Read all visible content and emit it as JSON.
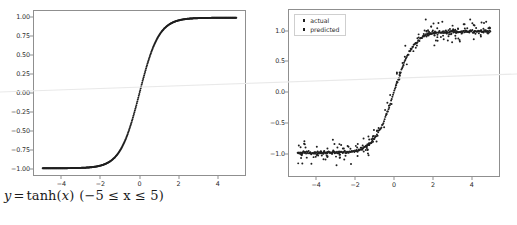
{
  "figure": {
    "background": "#ffffff",
    "marker_color": "#1f1f1f",
    "axis_color": "#8f8f8f",
    "text_color": "#2b2b2b"
  },
  "caption": {
    "full_text": "y = tanh(x) (−5 ≤ x ≤ 5)",
    "lhs": "y",
    "eq": "=",
    "func": "tanh",
    "arg_open": "(",
    "arg": "x",
    "arg_close": ")",
    "range_open": "(",
    "range_text": "−5 ≤ x ≤ 5",
    "range_close": ")"
  },
  "chart_data": [
    {
      "id": "left-tanh-plot",
      "type": "scatter",
      "title": "",
      "xlabel": "",
      "ylabel": "",
      "xlim": [
        -5.45,
        5.45
      ],
      "ylim": [
        -1.09,
        1.09
      ],
      "xticks": [
        -4,
        -2,
        0,
        2,
        4
      ],
      "xticklabels": [
        "−4",
        "−2",
        "0",
        "2",
        "4"
      ],
      "yticks": [
        1.0,
        0.75,
        0.5,
        0.25,
        0.0,
        -0.25,
        -0.5,
        -0.75,
        -1.0
      ],
      "yticklabels": [
        "1.00",
        "0.75",
        "0.50",
        "0.25",
        "0.00",
        "−0.25",
        "−0.50",
        "−0.75",
        "−1.00"
      ],
      "grid": false,
      "legend": null,
      "series": [
        {
          "name": "tanh(x)",
          "color": "#1f1f1f",
          "marker": "point",
          "marker_size": 2.0,
          "n_points": 400,
          "x_range": [
            -5,
            5
          ],
          "formula": "tanh",
          "noise_std": 0.0
        }
      ]
    },
    {
      "id": "right-actual-vs-predicted-plot",
      "type": "scatter",
      "title": "",
      "xlabel": "",
      "ylabel": "",
      "xlim": [
        -5.45,
        5.45
      ],
      "ylim": [
        -1.38,
        1.35
      ],
      "xticks": [
        -4,
        -2,
        0,
        2,
        4
      ],
      "xticklabels": [
        "−4",
        "−2",
        "0",
        "2",
        "4"
      ],
      "yticks": [
        1.0,
        0.5,
        0.0,
        -0.5,
        -1.0
      ],
      "yticklabels": [
        "1.0",
        "0.5",
        "0.0",
        "−0.5",
        "−1.0"
      ],
      "grid": false,
      "legend": {
        "position": "upper left",
        "entries": [
          "actual",
          "predicted"
        ]
      },
      "series": [
        {
          "name": "actual",
          "color": "#1f1f1f",
          "marker": "point",
          "marker_size": 2.0,
          "n_points": 200,
          "x_range": [
            -5,
            5
          ],
          "formula": "tanh",
          "noise_std": 0.1
        },
        {
          "name": "predicted",
          "color": "#1f1f1f",
          "marker": "point",
          "marker_size": 2.0,
          "n_points": 300,
          "x_range": [
            -5,
            5
          ],
          "formula": "tanh",
          "noise_std": 0.012
        }
      ]
    }
  ]
}
